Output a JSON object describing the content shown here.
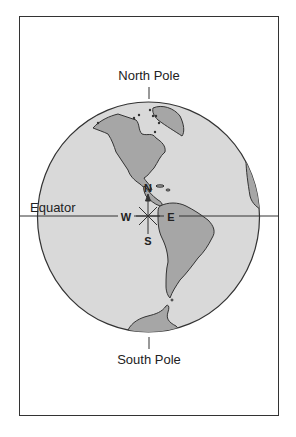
{
  "diagram": {
    "labels": {
      "north_pole": "North Pole",
      "south_pole": "South Pole",
      "equator": "Equator"
    },
    "compass": {
      "north": "N",
      "south": "S",
      "east": "E",
      "west": "W"
    },
    "colors": {
      "ocean": "#d9d9d9",
      "land": "#a6a6a6",
      "outline": "#333333",
      "background": "#ffffff"
    }
  }
}
